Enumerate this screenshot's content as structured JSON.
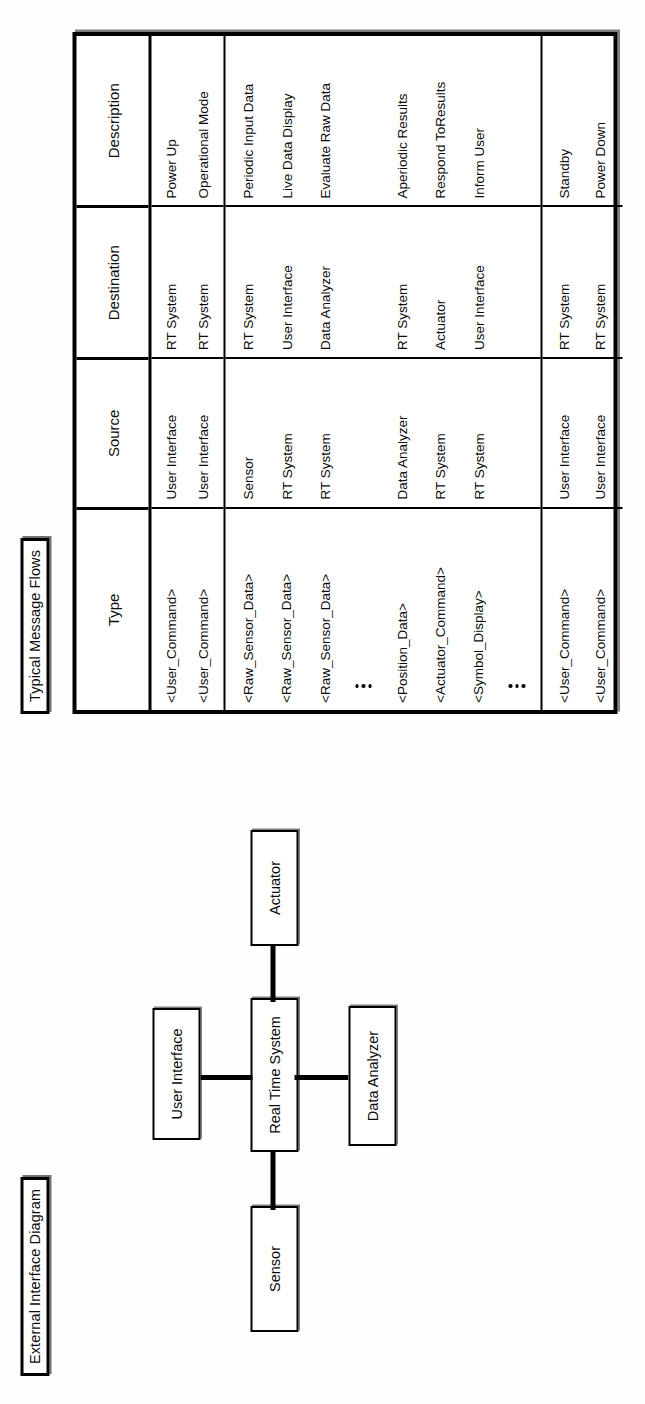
{
  "page": {
    "orientation": "rotated-90-ccw",
    "background": "#fefefe",
    "ink": "#000000"
  },
  "diagram": {
    "title": "External Interface Diagram",
    "center_node": "Real Time System",
    "nodes": [
      {
        "id": "sensor",
        "label": "Sensor",
        "position": "left-of-center"
      },
      {
        "id": "user-interface",
        "label": "User Interface",
        "position": "above-center"
      },
      {
        "id": "actuator",
        "label": "Actuator",
        "position": "right-of-center"
      },
      {
        "id": "data-analyzer",
        "label": "Data Analyzer",
        "position": "below-center"
      }
    ],
    "connections": [
      {
        "from": "Sensor",
        "to": "Real Time System"
      },
      {
        "from": "User Interface",
        "to": "Real Time System"
      },
      {
        "from": "Real Time System",
        "to": "Actuator"
      },
      {
        "from": "Real Time System",
        "to": "Data Analyzer"
      }
    ]
  },
  "message_flows": {
    "title": "Typical Message Flows",
    "columns": [
      "Type",
      "Source",
      "Destination",
      "Description"
    ],
    "groups": [
      {
        "id": "startup",
        "rows": [
          {
            "type": "<User_Command>",
            "source": "User Interface",
            "destination": "RT System",
            "description": "Power Up"
          },
          {
            "type": "<User_Command>",
            "source": "User Interface",
            "destination": "RT System",
            "description": "Operational Mode"
          }
        ]
      },
      {
        "id": "operational",
        "rows": [
          {
            "type": "<Raw_Sensor_Data>",
            "source": "Sensor",
            "destination": "RT System",
            "description": "Periodic Input Data"
          },
          {
            "type": "<Raw_Sensor_Data>",
            "source": "RT System",
            "destination": "User Interface",
            "description": "Live Data Display"
          },
          {
            "type": "<Raw_Sensor_Data>",
            "source": "RT System",
            "destination": "Data Analyzer",
            "description": "Evaluate Raw Data"
          },
          {
            "type": "ellipsis",
            "source": "",
            "destination": "",
            "description": ""
          },
          {
            "type": "<Position_Data>",
            "source": "Data Analyzer",
            "destination": "RT System",
            "description": "Aperiodic Results"
          },
          {
            "type": "<Actuator_Command>",
            "source": "RT System",
            "destination": "Actuator",
            "description": "Respond ToResults"
          },
          {
            "type": "<Symbol_Display>",
            "source": "RT System",
            "destination": "User Interface",
            "description": "Inform User"
          },
          {
            "type": "ellipsis",
            "source": "",
            "destination": "",
            "description": ""
          }
        ]
      },
      {
        "id": "shutdown",
        "rows": [
          {
            "type": "<User_Command>",
            "source": "User Interface",
            "destination": "RT System",
            "description": "Standby"
          },
          {
            "type": "<User_Command>",
            "source": "User Interface",
            "destination": "RT System",
            "description": "Power Down"
          }
        ]
      }
    ]
  }
}
